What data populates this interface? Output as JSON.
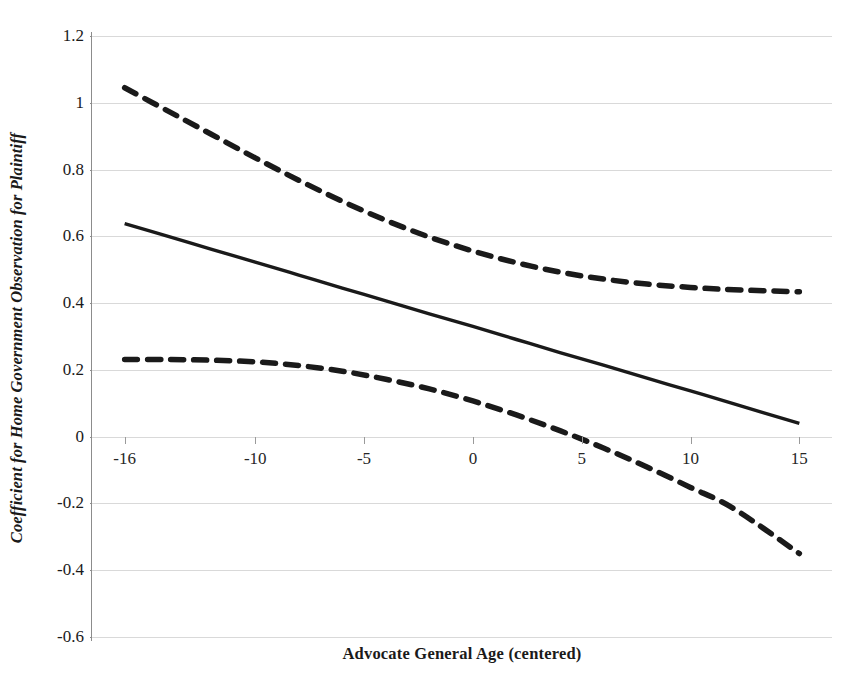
{
  "chart_data": {
    "type": "line",
    "title": "",
    "xlabel": "Advocate General Age (centered)",
    "ylabel": "Coefficient for Home Government Observation for Plaintiff",
    "xlim": [
      -17.5,
      16.5
    ],
    "ylim": [
      -0.6,
      1.2
    ],
    "xticks": [
      -16,
      -10,
      -5,
      0,
      5,
      10,
      15
    ],
    "xticklabels": [
      "-16",
      "-10",
      "-5",
      "0",
      "5",
      "10",
      "15"
    ],
    "yticks": [
      1.2,
      1,
      0.8,
      0.6,
      0.4,
      0.2,
      0,
      -0.2,
      -0.4,
      -0.6
    ],
    "yticklabels": [
      "1.2",
      "1",
      "0.8",
      "0.6",
      "0.4",
      "0.2",
      "0",
      "-0.2",
      "-0.4",
      "-0.6"
    ],
    "grid": true,
    "grid_axis": "y",
    "legend": null,
    "legend_position": "none",
    "x": [
      -16,
      -14,
      -12,
      -10,
      -8,
      -6,
      -4,
      -2,
      0,
      2,
      4,
      6,
      8,
      10,
      12,
      15
    ],
    "series": [
      {
        "name": "Upper 95% confidence bound",
        "style": "dashed",
        "color": "#1a1a1a",
        "values": [
          1.045,
          0.975,
          0.905,
          0.835,
          0.768,
          0.705,
          0.648,
          0.598,
          0.556,
          0.521,
          0.493,
          0.472,
          0.457,
          0.447,
          0.44,
          0.434
        ]
      },
      {
        "name": "Point estimate",
        "style": "solid",
        "color": "#1a1a1a",
        "values": [
          0.638,
          0.6,
          0.561,
          0.523,
          0.484,
          0.445,
          0.407,
          0.368,
          0.33,
          0.291,
          0.252,
          0.214,
          0.175,
          0.137,
          0.098,
          0.04
        ]
      },
      {
        "name": "Lower 95% confidence bound",
        "style": "dashed",
        "color": "#1a1a1a",
        "values": [
          0.231,
          0.231,
          0.229,
          0.224,
          0.213,
          0.196,
          0.172,
          0.143,
          0.107,
          0.065,
          0.018,
          -0.034,
          -0.091,
          -0.152,
          -0.216,
          -0.35
        ]
      }
    ]
  },
  "axis": {
    "x_title": "Advocate General Age (centered)",
    "y_title": "Coefficient for Home Government Observation for Plaintiff"
  },
  "colors": {
    "line": "#1a1a1a",
    "grid": "#d9d9d9",
    "axis": "#8c8c8c",
    "background": "#ffffff"
  }
}
